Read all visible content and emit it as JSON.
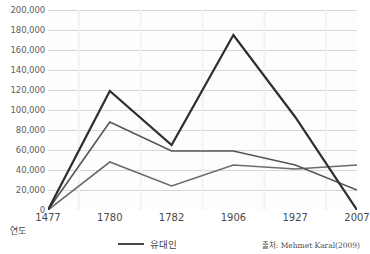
{
  "title": "",
  "axis": {
    "x_name": "연도",
    "y_ticks": [
      "200,000",
      "180,000",
      "160,000",
      "140,000",
      "120,000",
      "100,000",
      "80,000",
      "60,000",
      "40,000",
      "20,000",
      "0"
    ],
    "x_ticks": [
      "1477",
      "1780",
      "1782",
      "1906",
      "1927",
      "2007"
    ]
  },
  "legend": {
    "label": "유대인",
    "color": "#4a4a4a"
  },
  "source": "출처: Mehmet Karal(2009)",
  "colors": {
    "series1": "#2e2e2e",
    "series2": "#555555",
    "series3": "#6b6b6b",
    "grid": "#d6d6d6",
    "plot_bg": "#fdfdfd"
  },
  "chart_data": {
    "type": "line",
    "title": "",
    "xlabel": "연도",
    "ylabel": "",
    "categories": [
      "1477",
      "1780",
      "1782",
      "1906",
      "1927",
      "2007"
    ],
    "ylim": [
      0,
      200000
    ],
    "ytick_step": 20000,
    "grid": true,
    "legend_position": "bottom",
    "series": [
      {
        "name": "유대인",
        "color": "#2e2e2e",
        "width": 2.2,
        "values": [
          0,
          119000,
          65000,
          175000,
          93000,
          0
        ]
      },
      {
        "name": "series-2",
        "color": "#555555",
        "width": 1.6,
        "values": [
          0,
          88000,
          59000,
          59000,
          45000,
          20000
        ]
      },
      {
        "name": "series-3",
        "color": "#6b6b6b",
        "width": 1.6,
        "values": [
          0,
          48000,
          24000,
          45000,
          41000,
          45000
        ]
      }
    ]
  }
}
